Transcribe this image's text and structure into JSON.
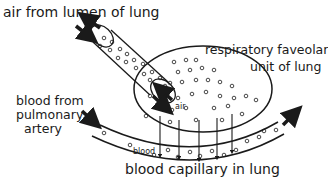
{
  "labels": {
    "air_source": "air from lumen of lung",
    "alveolus_line1": "respiratory faveolar",
    "alveolus_line2": "unit of lung",
    "blood_source_line1": "blood from",
    "blood_source_line2": "pulmonary",
    "blood_source_line3": "artery",
    "inner_air": "air",
    "inner_blood": "blood",
    "capillary": "blood capillary in lung"
  },
  "colors": {
    "stroke": "#1a1a1a",
    "background": "#ffffff"
  },
  "icons": {
    "bidirectional_arrow_top": "double-arrow-icon",
    "bidirectional_arrow_entry": "double-arrow-icon",
    "blood_in_arrow": "arrow-icon",
    "blood_out_arrow": "arrow-icon",
    "diffusion_arrows": "down-arrow-icon"
  }
}
